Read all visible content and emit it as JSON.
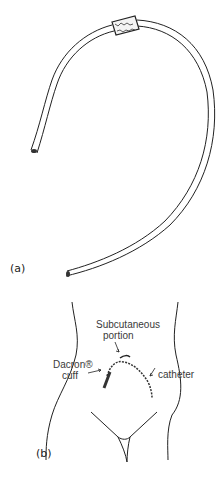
{
  "figure": {
    "panel_a": {
      "label": "(a)",
      "items": [
        "catheter-tube",
        "dacron-cuff"
      ]
    },
    "panel_b": {
      "label": "(b)",
      "annotations": {
        "subcutaneous_line1": "Subcutaneous",
        "subcutaneous_line2": "portion",
        "dacron_line1": "Dacron®",
        "dacron_line2": "cuff",
        "catheter": "catheter"
      }
    }
  }
}
